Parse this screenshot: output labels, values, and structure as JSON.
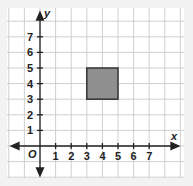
{
  "figure": {
    "x_axis_label": "x",
    "y_axis_label": "y",
    "origin_label": "O",
    "x_ticks": [
      "1",
      "2",
      "3",
      "4",
      "5",
      "6",
      "7"
    ],
    "y_ticks": [
      "1",
      "2",
      "3",
      "4",
      "5",
      "6",
      "7"
    ],
    "colors": {
      "background": "#f2f2f2",
      "panel": "#ffffff",
      "grid": "#cfcfcf",
      "axis": "#222222",
      "square_fill": "#8f8f8f",
      "square_stroke": "#333333"
    },
    "shape": {
      "type": "square",
      "vertices": [
        [
          3,
          3
        ],
        [
          5,
          3
        ],
        [
          5,
          5
        ],
        [
          3,
          5
        ]
      ]
    }
  }
}
